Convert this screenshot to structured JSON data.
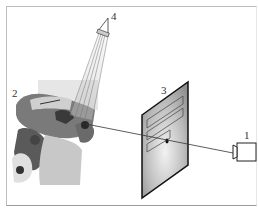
{
  "figure": {
    "labels": [
      {
        "id": "1",
        "text": "1",
        "refers_to": "camera"
      },
      {
        "id": "2",
        "text": "2",
        "refers_to": "bone-anatomy"
      },
      {
        "id": "3",
        "text": "3",
        "refers_to": "image-plane"
      },
      {
        "id": "4",
        "text": "4",
        "refers_to": "projector"
      }
    ],
    "colors": {
      "frame": "#bdbdbd",
      "line": "#222222",
      "bone_dark": "#3a3a3a",
      "bone_mid": "#8a8a8a",
      "bone_light": "#d9d9d9"
    }
  }
}
